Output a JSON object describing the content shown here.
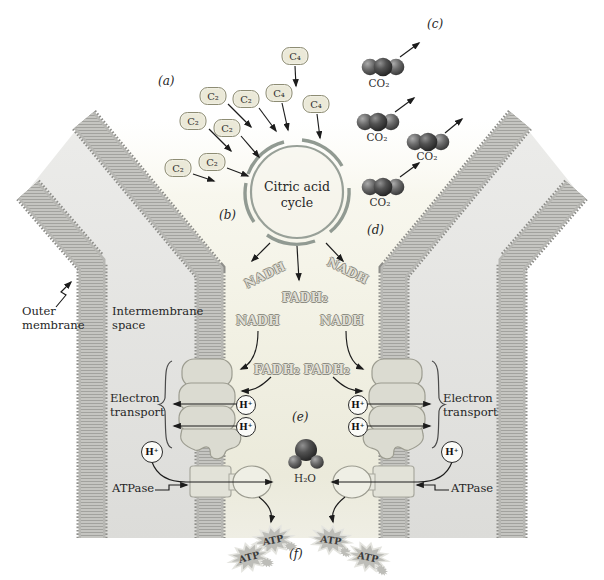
{
  "figure": {
    "panels": {
      "a": "(a)",
      "b": "(b)",
      "c": "(c)",
      "d": "(d)",
      "e": "(e)",
      "f": "(f)"
    },
    "labels": {
      "outer_membrane": "Outer membrane",
      "intermembrane_space": "Intermembrane space",
      "electron_transport_left": "Electron transport",
      "electron_transport_right": "Electron transport",
      "atpase_left": "ATPase",
      "atpase_right": "ATPase",
      "citric_acid_cycle": "Citric acid cycle"
    },
    "molecules": {
      "c2": "C₂",
      "c4": "C₄",
      "co2": "CO₂",
      "nadh": "NADH",
      "fadh2": "FADH₂",
      "h2o": "H₂O",
      "h_plus": "H⁺",
      "atp": "ATP"
    }
  }
}
